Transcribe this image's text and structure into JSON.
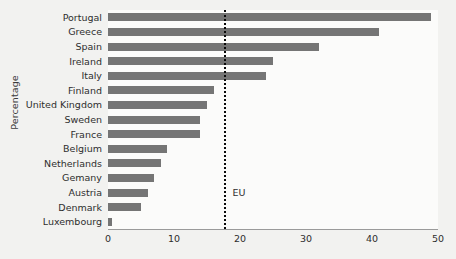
{
  "chart_data": {
    "type": "bar",
    "orientation": "horizontal",
    "title": "",
    "xlabel": "",
    "ylabel": "Percentage",
    "xlim": [
      0,
      50
    ],
    "xticks": [
      0,
      10,
      20,
      30,
      40,
      50
    ],
    "grid": false,
    "legend": null,
    "bar_color": "#757575",
    "categories": [
      "Portugal",
      "Greece",
      "Spain",
      "Ireland",
      "Italy",
      "Finland",
      "United Kingdom",
      "Sweden",
      "France",
      "Belgium",
      "Netherlands",
      "Gemany",
      "Austria",
      "Denmark",
      "Luxembourg"
    ],
    "values": [
      49,
      41,
      32,
      25,
      24,
      16,
      15,
      14,
      14,
      9,
      8,
      7,
      6,
      5,
      0.6
    ],
    "annotations": [
      {
        "name": "EU",
        "label": "EU",
        "type": "vertical-reference-line",
        "value": 17.5,
        "style": "dotted",
        "color": "#0a0a0a"
      }
    ]
  }
}
